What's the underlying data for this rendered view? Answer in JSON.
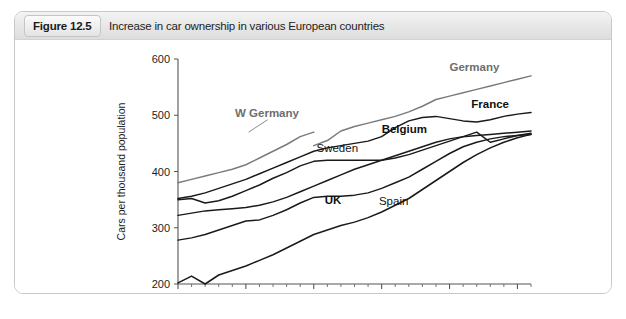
{
  "figure": {
    "number": "Figure 12.5",
    "caption": "Increase in car ownership in various European countries"
  },
  "chart_data": {
    "type": "line",
    "title": "Increase in car ownership in various European countries",
    "xlabel": "",
    "ylabel": "Cars per thousand population",
    "xlim": [
      1980,
      2006
    ],
    "ylim": [
      200,
      600
    ],
    "grid": false,
    "legend_position": "inline-labels",
    "xticks": [
      1980,
      1985,
      1990,
      1995,
      2000,
      2005
    ],
    "xtick_labels": [
      "1980",
      "1985",
      "1990",
      "1995",
      "2000",
      "2005"
    ],
    "yticks": [
      200,
      300,
      400,
      500,
      600
    ],
    "ytick_labels": [
      "200",
      "300",
      "400",
      "500",
      "600"
    ],
    "x": [
      1980,
      1981,
      1982,
      1983,
      1984,
      1985,
      1986,
      1987,
      1988,
      1989,
      1990,
      1991,
      1992,
      1993,
      1994,
      1995,
      1996,
      1997,
      1998,
      1999,
      2000,
      2001,
      2002,
      2003,
      2004,
      2005,
      2006
    ],
    "series": [
      {
        "name": "W Germany",
        "label": "W Germany",
        "color": "#7b7b7b",
        "style": "grey",
        "x": [
          1980,
          1981,
          1982,
          1983,
          1984,
          1985,
          1986,
          1987,
          1988,
          1989,
          1990
        ],
        "values": [
          380,
          386,
          392,
          398,
          404,
          412,
          424,
          436,
          448,
          462,
          470
        ]
      },
      {
        "name": "Germany",
        "label": "Germany",
        "color": "#7b7b7b",
        "style": "grey",
        "x": [
          1990,
          1991,
          1992,
          1993,
          1994,
          1995,
          1996,
          1997,
          1998,
          1999,
          2000,
          2001,
          2002,
          2003,
          2004,
          2005,
          2006
        ],
        "values": [
          446,
          455,
          472,
          480,
          486,
          492,
          498,
          506,
          516,
          528,
          534,
          540,
          546,
          552,
          558,
          564,
          570
        ]
      },
      {
        "name": "France",
        "label": "France",
        "color": "#1a1a1a",
        "style": "dark",
        "x": [
          1980,
          1981,
          1982,
          1983,
          1984,
          1985,
          1986,
          1987,
          1988,
          1989,
          1990,
          1991,
          1992,
          1993,
          1994,
          1995,
          1996,
          1997,
          1998,
          1999,
          2000,
          2001,
          2002,
          2003,
          2004,
          2005,
          2006
        ],
        "values": [
          352,
          356,
          362,
          370,
          378,
          386,
          396,
          406,
          416,
          426,
          436,
          442,
          446,
          450,
          454,
          462,
          478,
          490,
          496,
          498,
          494,
          490,
          488,
          492,
          498,
          502,
          505
        ]
      },
      {
        "name": "Belgium",
        "label": "Belgium",
        "color": "#1a1a1a",
        "style": "dark",
        "x": [
          1980,
          1981,
          1982,
          1983,
          1984,
          1985,
          1986,
          1987,
          1988,
          1989,
          1990,
          1991,
          1992,
          1993,
          1994,
          1995,
          1996,
          1997,
          1998,
          1999,
          2000,
          2001,
          2002,
          2003,
          2004,
          2005,
          2006
        ],
        "values": [
          322,
          326,
          330,
          332,
          334,
          336,
          340,
          346,
          354,
          364,
          374,
          384,
          394,
          404,
          412,
          420,
          428,
          436,
          444,
          452,
          458,
          462,
          464,
          466,
          468,
          470,
          472
        ]
      },
      {
        "name": "Sweden",
        "label": "Sweden",
        "color": "#1a1a1a",
        "style": "dark",
        "x": [
          1980,
          1981,
          1982,
          1983,
          1984,
          1985,
          1986,
          1987,
          1988,
          1989,
          1990,
          1991,
          1992,
          1993,
          1994,
          1995,
          1996,
          1997,
          1998,
          1999,
          2000,
          2001,
          2002,
          2003,
          2004,
          2005,
          2006
        ],
        "values": [
          350,
          352,
          344,
          348,
          356,
          366,
          376,
          388,
          398,
          410,
          418,
          420,
          420,
          420,
          420,
          420,
          424,
          430,
          438,
          446,
          454,
          462,
          470,
          452,
          458,
          464,
          468
        ],
        "note": "dips sharply around 2003 then recovers"
      },
      {
        "name": "UK",
        "label": "UK",
        "color": "#1a1a1a",
        "style": "dark",
        "x": [
          1980,
          1981,
          1982,
          1983,
          1984,
          1985,
          1986,
          1987,
          1988,
          1989,
          1990,
          1991,
          1992,
          1993,
          1994,
          1995,
          1996,
          1997,
          1998,
          1999,
          2000,
          2001,
          2002,
          2003,
          2004,
          2005,
          2006
        ],
        "values": [
          278,
          282,
          288,
          296,
          304,
          312,
          314,
          322,
          332,
          344,
          354,
          356,
          356,
          358,
          362,
          370,
          380,
          390,
          404,
          418,
          432,
          444,
          452,
          458,
          462,
          464,
          466
        ]
      },
      {
        "name": "Spain",
        "label": "Spain",
        "color": "#1a1a1a",
        "style": "dark",
        "x": [
          1980,
          1981,
          1982,
          1983,
          1984,
          1985,
          1986,
          1987,
          1988,
          1989,
          1990,
          1991,
          1992,
          1993,
          1994,
          1995,
          1996,
          1997,
          1998,
          1999,
          2000,
          2001,
          2002,
          2003,
          2004,
          2005,
          2006
        ],
        "values": [
          202,
          214,
          200,
          216,
          224,
          232,
          242,
          252,
          264,
          276,
          288,
          296,
          304,
          310,
          318,
          328,
          340,
          352,
          368,
          384,
          400,
          416,
          430,
          442,
          452,
          460,
          466
        ]
      }
    ],
    "annotations": [
      {
        "text": "W Germany",
        "x": 1984.2,
        "y": 497,
        "weight": "bold",
        "color": "#6e6e6e"
      },
      {
        "text": "Germany",
        "x": 2000.0,
        "y": 578,
        "weight": "bold",
        "color": "#6e6e6e"
      },
      {
        "text": "France",
        "x": 2001.6,
        "y": 513,
        "weight": "bold",
        "color": "#111111"
      },
      {
        "text": "Belgium",
        "x": 1995.0,
        "y": 468,
        "weight": "bold",
        "color": "#111111"
      },
      {
        "text": "Sweden",
        "x": 1990.2,
        "y": 434,
        "weight": "normal",
        "color": "#111111"
      },
      {
        "text": "UK",
        "x": 1990.8,
        "y": 343,
        "weight": "bold",
        "color": "#111111"
      },
      {
        "text": "Spain",
        "x": 1994.8,
        "y": 340,
        "weight": "normal",
        "color": "#111111"
      }
    ]
  }
}
